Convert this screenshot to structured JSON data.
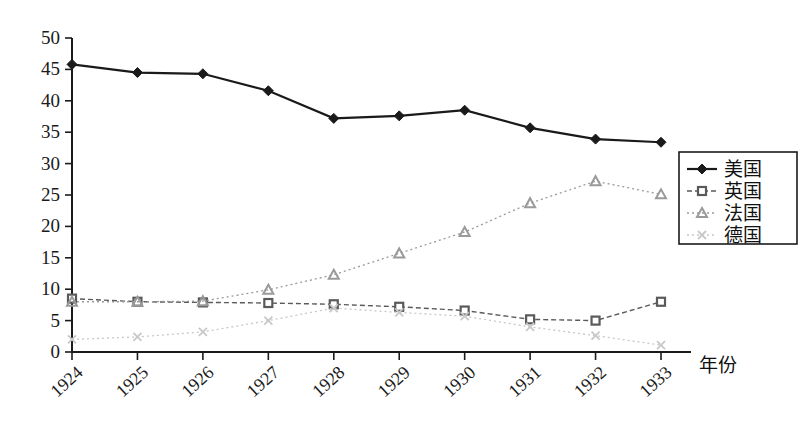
{
  "chart_data": {
    "type": "line",
    "title": "",
    "subtitle": "",
    "xlabel": "年份",
    "ylabel": "",
    "xlim": [
      1924,
      1933
    ],
    "ylim": [
      0,
      50
    ],
    "ytick_step": 5,
    "grid": false,
    "legend_position": "right",
    "categories": [
      "1924",
      "1925",
      "1926",
      "1927",
      "1928",
      "1929",
      "1930",
      "1931",
      "1932",
      "1933"
    ],
    "yticks": [
      "0",
      "5",
      "10",
      "15",
      "20",
      "25",
      "30",
      "35",
      "40",
      "45",
      "50"
    ],
    "series": [
      {
        "name": "美国",
        "marker": "diamond",
        "line_style": "solid",
        "color": "#1a1a1a",
        "values": [
          45.8,
          44.5,
          44.3,
          41.6,
          37.2,
          37.6,
          38.5,
          35.7,
          33.9,
          33.4
        ]
      },
      {
        "name": "英国",
        "marker": "square",
        "line_style": "dashed",
        "color": "#5a5a5a",
        "values": [
          8.5,
          8.0,
          7.9,
          7.8,
          7.6,
          7.2,
          6.6,
          5.2,
          5.0,
          8.0
        ]
      },
      {
        "name": "法国",
        "marker": "triangle",
        "line_style": "dotted",
        "color": "#9a9a9a",
        "values": [
          8.0,
          8.0,
          8.1,
          9.9,
          12.3,
          15.7,
          19.1,
          23.7,
          27.2,
          25.1
        ]
      },
      {
        "name": "德国",
        "marker": "cross",
        "line_style": "dotted",
        "color": "#c8c8c8",
        "values": [
          2.0,
          2.4,
          3.2,
          5.0,
          7.0,
          6.3,
          5.7,
          4.0,
          2.6,
          1.1
        ]
      }
    ]
  },
  "legend": {
    "items": [
      {
        "label": "美国"
      },
      {
        "label": "英国"
      },
      {
        "label": "法国"
      },
      {
        "label": "德国"
      }
    ]
  },
  "axes": {
    "x_axis_title": "年份"
  }
}
